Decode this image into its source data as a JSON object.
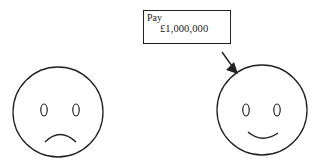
{
  "cheque": {
    "pay_label": "Pay",
    "amount": "£1,000,000"
  },
  "faces": [
    {
      "name": "sad-face",
      "expression": "sad"
    },
    {
      "name": "happy-face",
      "expression": "happy"
    }
  ],
  "colors": {
    "stroke": "#222222",
    "background": "#ffffff"
  }
}
